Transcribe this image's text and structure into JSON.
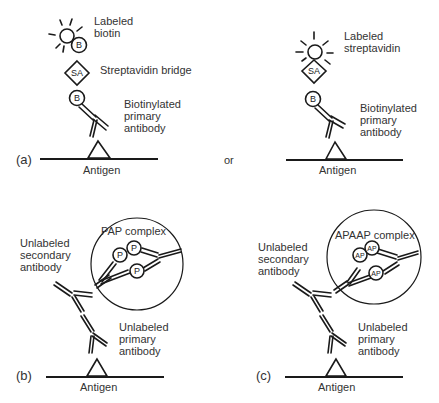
{
  "figure": {
    "panel_a_left": {
      "panel_label": "(a)",
      "labels": {
        "labeled_biotin_line1": "Labeled",
        "labeled_biotin_line2": "biotin",
        "streptavidin_bridge": "Streptavidin bridge",
        "primary_line1": "Biotinylated",
        "primary_line2": "primary",
        "primary_line3": "antibody",
        "antigen": "Antigen"
      },
      "glyphs": {
        "biotin_top": "B",
        "streptavidin": "SA",
        "biotin_bottom": "B"
      }
    },
    "connector": {
      "text": "or"
    },
    "panel_a_right": {
      "labels": {
        "labeled_streptavidin_line1": "Labeled",
        "labeled_streptavidin_line2": "streptavidin",
        "primary_line1": "Biotinylated",
        "primary_line2": "primary",
        "primary_line3": "antibody",
        "antigen": "Antigen"
      },
      "glyphs": {
        "streptavidin": "SA",
        "biotin": "B"
      }
    },
    "panel_b": {
      "panel_label": "(b)",
      "labels": {
        "complex": "PAP complex",
        "secondary_line1": "Unlabeled",
        "secondary_line2": "secondary",
        "secondary_line3": "antibody",
        "primary_line1": "Unlabeled",
        "primary_line2": "primary",
        "primary_line3": "antibody",
        "antigen": "Antigen"
      },
      "glyphs": {
        "enzyme": "P"
      }
    },
    "panel_c": {
      "panel_label": "(c)",
      "labels": {
        "complex": "APAAP complex",
        "secondary_line1": "Unlabeled",
        "secondary_line2": "secondary",
        "secondary_line3": "antibody",
        "primary_line1": "Unlabeled",
        "primary_line2": "primary",
        "primary_line3": "antibody",
        "antigen": "Antigen"
      },
      "glyphs": {
        "enzyme": "AP"
      }
    }
  }
}
